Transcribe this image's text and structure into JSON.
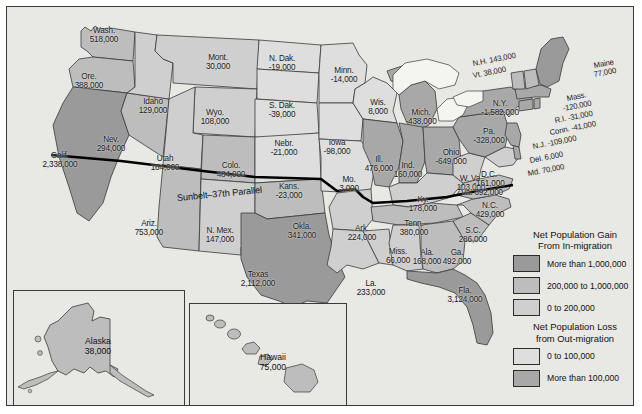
{
  "map": {
    "title_line": "Sunbelt–37th Parallel",
    "colors": {
      "gain_over_1m": "#9a9a9a",
      "gain_200k_1m": "#bdbdbd",
      "gain_0_200k": "#cfcfcf",
      "loss_0_100k": "#dcdcd8",
      "loss_over_100k": "#a8a8a8",
      "water": "#f2f2ef",
      "background": "#e8e8e4",
      "border": "#3a3a3a",
      "text": "#1a1a1a"
    }
  },
  "legend": {
    "gain_heading": "Net Population Gain\nFrom In-migration",
    "gain_heading_l1": "Net Population Gain",
    "gain_heading_l2": "From In-migration",
    "loss_heading_l1": "Net Population Loss",
    "loss_heading_l2": "from Out-migration",
    "items_gain": [
      {
        "label": "More than 1,000,000",
        "color": "#9a9a9a"
      },
      {
        "label": "200,000 to 1,000,000",
        "color": "#bdbdbd"
      },
      {
        "label": "0 to 200,000",
        "color": "#cfcfcf"
      }
    ],
    "items_loss": [
      {
        "label": "0 to 100,000",
        "color": "#dedede"
      },
      {
        "label": "More than 100,000",
        "color": "#a8a8a8"
      }
    ]
  },
  "insets": {
    "alaska": {
      "name": "Alaska",
      "value": "38,000"
    },
    "hawaii": {
      "name": "Hawaii",
      "value": "75,000"
    }
  },
  "states": [
    {
      "abbr": "Wash.",
      "value": "518,000",
      "x": 97,
      "y": 28,
      "cls": ""
    },
    {
      "abbr": "Ore.",
      "value": "388,000",
      "x": 82,
      "y": 74,
      "cls": ""
    },
    {
      "abbr": "Calif.",
      "value": "2,338,000",
      "x": 53,
      "y": 153,
      "cls": ""
    },
    {
      "abbr": "Nev.",
      "value": "294,000",
      "x": 104,
      "y": 137,
      "cls": ""
    },
    {
      "abbr": "Idaho",
      "value": "129,000",
      "x": 146,
      "y": 99,
      "cls": ""
    },
    {
      "abbr": "Mont.",
      "value": "30,000",
      "x": 211,
      "y": 55,
      "cls": ""
    },
    {
      "abbr": "Wyo.",
      "value": "108,000",
      "x": 208,
      "y": 110,
      "cls": ""
    },
    {
      "abbr": "Utah",
      "value": "164,000",
      "x": 158,
      "y": 156,
      "cls": ""
    },
    {
      "abbr": "Colo.",
      "value": "484,000",
      "x": 224,
      "y": 163,
      "cls": ""
    },
    {
      "abbr": "Ariz.",
      "value": "753,000",
      "x": 142,
      "y": 221,
      "cls": ""
    },
    {
      "abbr": "N. Mex.",
      "value": "147,000",
      "x": 213,
      "y": 228,
      "cls": ""
    },
    {
      "abbr": "N. Dak.",
      "value": "-19,000",
      "x": 275,
      "y": 56,
      "cls": ""
    },
    {
      "abbr": "S. Dak.",
      "value": "-39,000",
      "x": 275,
      "y": 103,
      "cls": ""
    },
    {
      "abbr": "Nebr.",
      "value": "-21,000",
      "x": 277,
      "y": 141,
      "cls": ""
    },
    {
      "abbr": "Kans.",
      "value": "-23,000",
      "x": 282,
      "y": 184,
      "cls": ""
    },
    {
      "abbr": "Okla.",
      "value": "341,000",
      "x": 295,
      "y": 224,
      "cls": ""
    },
    {
      "abbr": "Texas",
      "value": "2,112,000",
      "x": 251,
      "y": 272,
      "cls": ""
    },
    {
      "abbr": "Minn.",
      "value": "-14,000",
      "x": 337,
      "y": 68,
      "cls": ""
    },
    {
      "abbr": "Iowa",
      "value": "-98,000",
      "x": 330,
      "y": 140,
      "cls": ""
    },
    {
      "abbr": "Mo.",
      "value": "3,000",
      "x": 342,
      "y": 177,
      "cls": ""
    },
    {
      "abbr": "Ark.",
      "value": "224,000",
      "x": 355,
      "y": 226,
      "cls": ""
    },
    {
      "abbr": "La.",
      "value": "233,000",
      "x": 364,
      "y": 281,
      "cls": ""
    },
    {
      "abbr": "Wis.",
      "value": "8,000",
      "x": 371,
      "y": 100,
      "cls": ""
    },
    {
      "abbr": "Ill.",
      "value": "476,000",
      "x": 372,
      "y": 157,
      "cls": ""
    },
    {
      "abbr": "Miss.",
      "value": "66,000",
      "x": 391,
      "y": 249,
      "cls": ""
    },
    {
      "abbr": "Mich.",
      "value": "-438,000",
      "x": 414,
      "y": 110,
      "cls": ""
    },
    {
      "abbr": "Ind.",
      "value": "160,000",
      "x": 401,
      "y": 163,
      "cls": ""
    },
    {
      "abbr": "Ky.",
      "value": "178,000",
      "x": 416,
      "y": 197,
      "cls": ""
    },
    {
      "abbr": "Tenn.",
      "value": "380,000",
      "x": 407,
      "y": 221,
      "cls": ""
    },
    {
      "abbr": "Ala.",
      "value": "168,000",
      "x": 420,
      "y": 250,
      "cls": ""
    },
    {
      "abbr": "Ohio",
      "value": "-649,000",
      "x": 444,
      "y": 150,
      "cls": ""
    },
    {
      "abbr": "W. Va.",
      "value": "103,000",
      "x": 464,
      "y": 176,
      "cls": ""
    },
    {
      "abbr": "Ga.",
      "value": "492,000",
      "x": 450,
      "y": 250,
      "cls": ""
    },
    {
      "abbr": "Fla.",
      "value": "3,124,000",
      "x": 458,
      "y": 288,
      "cls": ""
    },
    {
      "abbr": "S.C.",
      "value": "286,000",
      "x": 466,
      "y": 228,
      "cls": ""
    },
    {
      "abbr": "N.C.",
      "value": "429,000",
      "x": 483,
      "y": 203,
      "cls": ""
    },
    {
      "abbr": "Va.",
      "value": "392,000",
      "x": 475,
      "y": 190,
      "cls": "one"
    },
    {
      "abbr": "D.C.",
      "value": "-161,000",
      "x": 482,
      "y": 172,
      "cls": ""
    },
    {
      "abbr": "Pa.",
      "value": "-328,000",
      "x": 482,
      "y": 129,
      "cls": ""
    },
    {
      "abbr": "N.Y.",
      "value": "-1,582,000",
      "x": 493,
      "y": 101,
      "cls": ""
    }
  ],
  "states_inline": [
    {
      "text": "N.H. 143,000",
      "x": 466,
      "y": 53
    },
    {
      "text": "Vt. 38,000",
      "x": 466,
      "y": 65
    },
    {
      "text": "Maine",
      "x": 587,
      "y": 55
    },
    {
      "text": "77,000",
      "x": 587,
      "y": 64
    },
    {
      "text": "Mass.",
      "x": 560,
      "y": 88
    },
    {
      "text": "-120,000",
      "x": 556,
      "y": 98
    },
    {
      "text": "R.I. -31,000",
      "x": 548,
      "y": 110
    },
    {
      "text": "Conn. -41,000",
      "x": 543,
      "y": 122
    },
    {
      "text": "N.J. -109,000",
      "x": 526,
      "y": 136
    },
    {
      "text": "Del. 6,000",
      "x": 523,
      "y": 150
    },
    {
      "text": "Md. 70,000",
      "x": 521,
      "y": 163
    }
  ]
}
